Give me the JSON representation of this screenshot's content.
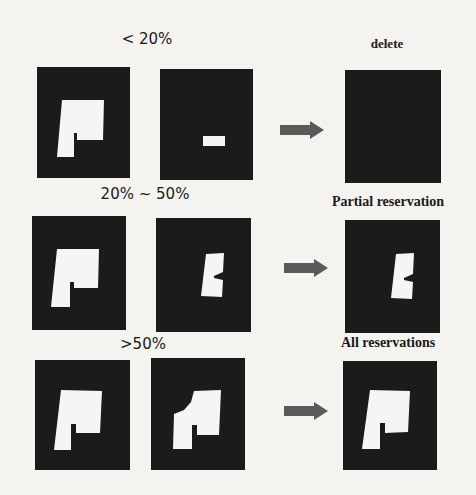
{
  "figure": {
    "rows": [
      {
        "condition_label": "< 20%",
        "result_label": "delete",
        "panels": {
          "original": "building-mask-l-shape",
          "detected": "small-rectangle-fragment",
          "result": "empty-black"
        }
      },
      {
        "condition_label": "20% ~ 50%",
        "result_label": "Partial reservation",
        "panels": {
          "original": "building-mask-l-shape",
          "detected": "partial-c-shape-fragment",
          "result": "partial-c-shape-fragment"
        }
      },
      {
        "condition_label": ">50%",
        "result_label": "All reservations",
        "panels": {
          "original": "building-mask-l-shape",
          "detected": "mostly-complete-shape",
          "result": "building-mask-l-shape"
        }
      }
    ],
    "arrow_icon": "right-arrow-icon",
    "colors": {
      "background": "#f4f3f0",
      "panel": "#1b1b1b",
      "shape": "#f5f5f5",
      "arrow": "#5a5a5a",
      "text": "#1a1a1a"
    }
  }
}
